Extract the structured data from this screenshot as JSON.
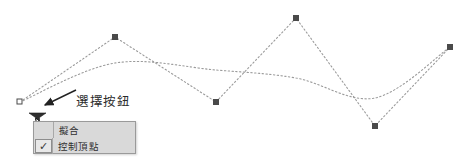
{
  "canvas": {
    "background_color": "#ffffff",
    "curve_color": "#9b9b9b",
    "control_point_color": "#4a4a4a",
    "control_point_size": 6
  },
  "annotation": {
    "label": "選擇按鈕",
    "arrow_name": "callout-arrow"
  },
  "select_button": {
    "name": "spline-dropdown-button",
    "color": "#2e2e2e"
  },
  "cursor": {
    "name": "mouse-pointer"
  },
  "context_menu": {
    "background_color": "#d9d9d9",
    "border_color": "#9a9a9a",
    "items": [
      {
        "label": "擬合",
        "checked": false
      },
      {
        "label": "控制頂點",
        "checked": true
      }
    ],
    "check_glyph": "✓"
  },
  "chart_data": {
    "type": "scatter",
    "title": "",
    "xlabel": "",
    "ylabel": "",
    "xlim": [
      0,
      468
    ],
    "ylim": [
      0,
      167
    ],
    "grid": false,
    "legend": null,
    "series": [
      {
        "name": "control-polygon",
        "style": "dotted-polyline",
        "points": [
          {
            "x": 20,
            "y": 102
          },
          {
            "x": 115,
            "y": 37
          },
          {
            "x": 216,
            "y": 102
          },
          {
            "x": 296,
            "y": 18
          },
          {
            "x": 375,
            "y": 126
          },
          {
            "x": 450,
            "y": 47
          }
        ]
      },
      {
        "name": "fit-curve",
        "style": "dotted-spline",
        "points": [
          {
            "x": 20,
            "y": 102
          },
          {
            "x": 115,
            "y": 63
          },
          {
            "x": 216,
            "y": 70
          },
          {
            "x": 296,
            "y": 78
          },
          {
            "x": 375,
            "y": 98
          },
          {
            "x": 450,
            "y": 47
          }
        ]
      }
    ],
    "control_points": [
      {
        "x": 20,
        "y": 102
      },
      {
        "x": 115,
        "y": 37
      },
      {
        "x": 216,
        "y": 102
      },
      {
        "x": 296,
        "y": 18
      },
      {
        "x": 375,
        "y": 126
      },
      {
        "x": 450,
        "y": 47
      }
    ]
  }
}
